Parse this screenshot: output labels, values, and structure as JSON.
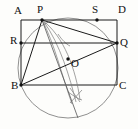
{
  "figure": {
    "background_color": "#fdfdfb",
    "line_color": "#1a1a1a",
    "arc_color": "#6b6b6b",
    "width": 138,
    "height": 129,
    "labels": {
      "A": "A",
      "P": "P",
      "S": "S",
      "D": "D",
      "R": "R",
      "Q": "Q",
      "O": "O",
      "B": "B",
      "C": "C"
    },
    "points": [
      {
        "name": "A",
        "label": "A",
        "x": 21,
        "y": 20,
        "label_x": 14,
        "label_y": 14,
        "dot": false
      },
      {
        "name": "P",
        "label": "P",
        "x": 42,
        "y": 20,
        "label_x": 37,
        "label_y": 13,
        "dot": true
      },
      {
        "name": "S",
        "label": "S",
        "x": 97,
        "y": 20,
        "label_x": 92,
        "label_y": 13,
        "dot": true
      },
      {
        "name": "D",
        "label": "D",
        "x": 117,
        "y": 20,
        "label_x": 118,
        "label_y": 13,
        "dot": false
      },
      {
        "name": "R",
        "label": "R",
        "x": 21,
        "y": 43,
        "label_x": 10,
        "label_y": 44,
        "dot": true
      },
      {
        "name": "Q",
        "label": "Q",
        "x": 117,
        "y": 43,
        "label_x": 120,
        "label_y": 46,
        "dot": true
      },
      {
        "name": "O",
        "label": "O",
        "x": 68,
        "y": 59,
        "label_x": 71,
        "label_y": 67,
        "dot": true
      },
      {
        "name": "B",
        "label": "B",
        "x": 21,
        "y": 85,
        "label_x": 11,
        "label_y": 89,
        "dot": true
      },
      {
        "name": "C",
        "label": "C",
        "x": 117,
        "y": 85,
        "label_x": 119,
        "label_y": 89,
        "dot": false
      }
    ],
    "rectangle": {
      "name": "ABCD",
      "x": 21,
      "y": 20,
      "width": 96,
      "height": 65
    },
    "circle": {
      "name": "circumscribed-circle",
      "cx": 68,
      "cy": 68,
      "r": 50
    },
    "segments": [
      {
        "name": "segment-PB",
        "x1": 42,
        "y1": 20,
        "x2": 21,
        "y2": 85
      },
      {
        "name": "segment-PQ",
        "x1": 42,
        "y1": 20,
        "x2": 117,
        "y2": 43
      },
      {
        "name": "segment-BQ",
        "x1": 21,
        "y1": 85,
        "x2": 117,
        "y2": 43
      },
      {
        "name": "segment-RQ",
        "x1": 21,
        "y1": 43,
        "x2": 117,
        "y2": 43
      },
      {
        "name": "segment-PO-extended",
        "x1": 42,
        "y1": 20,
        "x2": 78,
        "y2": 118
      }
    ],
    "construction_arcs": [
      {
        "name": "arc-left-lens",
        "d": "M 42 20 C 54 42, 62 76, 72 104"
      },
      {
        "name": "arc-right-lens",
        "d": "M 42 20 C 64 36, 76 70, 80 100"
      },
      {
        "name": "arc-mid-lens",
        "d": "M 44 22 C 60 44, 70 78, 76 102"
      },
      {
        "name": "tick-arc-upper",
        "d": "M 58 34 C 62 40, 66 44, 70 46"
      },
      {
        "name": "tick-arc-lower",
        "d": "M 68 92 C 74 96, 78 99, 82 100"
      },
      {
        "name": "cross-tick-a",
        "d": "M 70 88 L 80 102"
      },
      {
        "name": "cross-tick-b",
        "d": "M 82 90 L 70 103"
      }
    ]
  }
}
